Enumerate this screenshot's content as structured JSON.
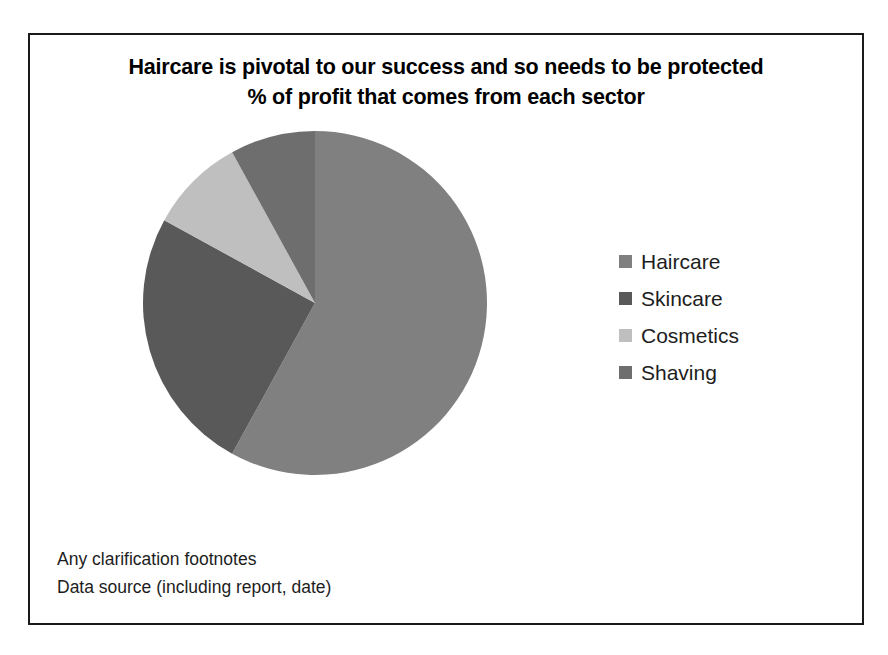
{
  "slide": {
    "title_line_1": "Haircare is pivotal to our success and so needs to be protected",
    "title_line_2": "% of profit that comes from each sector",
    "border_color": "#1a1a1a",
    "background_color": "#ffffff"
  },
  "legend": {
    "position": "right",
    "items": [
      {
        "label": "Haircare",
        "color": "#808080",
        "swatch_name": "legend-swatch-haircare"
      },
      {
        "label": "Skincare",
        "color": "#595959",
        "swatch_name": "legend-swatch-skincare"
      },
      {
        "label": "Cosmetics",
        "color": "#bfbfbf",
        "swatch_name": "legend-swatch-cosmetics"
      },
      {
        "label": "Shaving",
        "color": "#6e6e6e",
        "swatch_name": "legend-swatch-shaving"
      }
    ]
  },
  "footnotes": {
    "line_1": "Any clarification footnotes",
    "line_2": "Data source (including report, date)"
  },
  "chart_data": {
    "type": "pie",
    "title": "Haircare is pivotal to our success and so needs to be protected",
    "subtitle": "% of profit that comes from each sector",
    "xlabel": "",
    "ylabel": "",
    "value_unit": "% of profit",
    "start_angle_deg": 0,
    "direction": "clockwise",
    "grid": false,
    "legend_position": "right",
    "categories": [
      "Haircare",
      "Skincare",
      "Cosmetics",
      "Shaving"
    ],
    "values": [
      58,
      25,
      9,
      8
    ],
    "colors": [
      "#808080",
      "#595959",
      "#bfbfbf",
      "#6e6e6e"
    ],
    "slices": [
      {
        "label": "Haircare",
        "value": 58,
        "color": "#808080",
        "start_deg": 0,
        "end_deg": 208.8
      },
      {
        "label": "Skincare",
        "value": 25,
        "color": "#595959",
        "start_deg": 208.8,
        "end_deg": 298.8
      },
      {
        "label": "Cosmetics",
        "value": 9,
        "color": "#bfbfbf",
        "start_deg": 298.8,
        "end_deg": 331.2
      },
      {
        "label": "Shaving",
        "value": 8,
        "color": "#6e6e6e",
        "start_deg": 331.2,
        "end_deg": 360
      }
    ]
  }
}
